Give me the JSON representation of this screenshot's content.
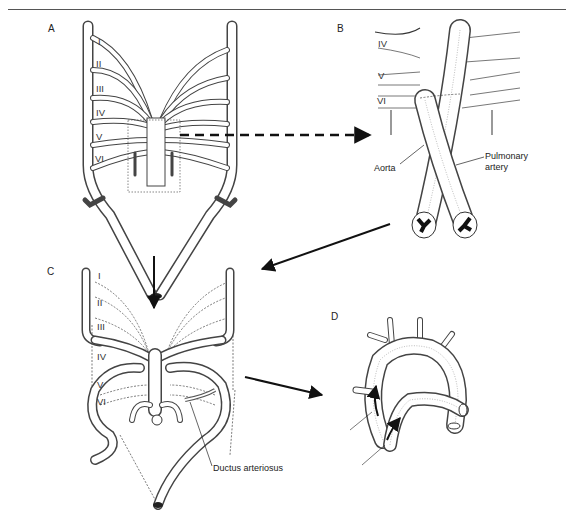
{
  "figure": {
    "panels": [
      {
        "id": "A",
        "label": "A"
      },
      {
        "id": "B",
        "label": "B"
      },
      {
        "id": "C",
        "label": "C"
      },
      {
        "id": "D",
        "label": "D"
      }
    ],
    "panel_a": {
      "arch_labels": [
        "I",
        "II",
        "III",
        "IV",
        "V",
        "VI"
      ]
    },
    "panel_b": {
      "arch_labels": [
        "IV",
        "V",
        "VI"
      ],
      "annotations": {
        "aorta": "Aorta",
        "pulmonary_line1": "Pulmonary",
        "pulmonary_line2": "artery"
      }
    },
    "panel_c": {
      "arch_labels": [
        "I",
        "II",
        "III",
        "IV",
        "V",
        "VI"
      ],
      "annotations": {
        "ductus": "Ductus arteriosus"
      }
    },
    "panel_d": {
      "annotations": []
    },
    "arrows": [
      {
        "from": "A",
        "to": "B",
        "style": "dashed"
      },
      {
        "from": "B",
        "to": "C",
        "style": "solid"
      },
      {
        "from": "A",
        "to": "C",
        "style": "solid"
      },
      {
        "from": "C",
        "to": "D",
        "style": "solid"
      }
    ]
  }
}
